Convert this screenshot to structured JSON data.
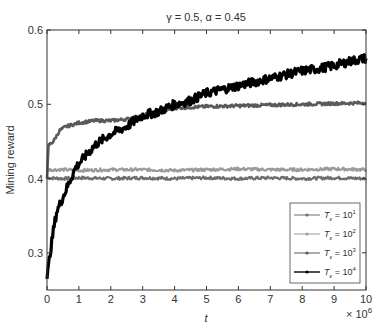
{
  "chart_data": {
    "type": "line",
    "title": "γ = 0.5,  α = 0.45",
    "xlabel": "t",
    "ylabel": "Mining reward",
    "x_multiplier_label": "× 10^6",
    "xlim": [
      0,
      10
    ],
    "ylim": [
      0.25,
      0.6
    ],
    "xticks": [
      0,
      1,
      2,
      3,
      4,
      5,
      6,
      7,
      8,
      9,
      10
    ],
    "yticks": [
      0.3,
      0.4,
      0.5,
      0.6
    ],
    "ytick_labels": [
      "0.3",
      "0.4",
      "0.5",
      "0.6"
    ],
    "grid": false,
    "legend_position": "lower right",
    "series": [
      {
        "name": "T_ε = 10^1",
        "legend_label": "T",
        "sub": "ε",
        "exp": "1",
        "color": "#6e6e6e",
        "width": 2.2,
        "x": [
          0,
          0.5,
          1,
          2,
          3,
          4,
          5,
          6,
          7,
          8,
          9,
          10
        ],
        "values": [
          0.401,
          0.4,
          0.401,
          0.4,
          0.401,
          0.4,
          0.401,
          0.4,
          0.401,
          0.4,
          0.401,
          0.4
        ]
      },
      {
        "name": "T_ε = 10^2",
        "legend_label": "T",
        "sub": "ε",
        "exp": "2",
        "color": "#9a9a9a",
        "width": 2.2,
        "x": [
          0,
          0.5,
          1,
          2,
          3,
          4,
          5,
          6,
          7,
          8,
          9,
          10
        ],
        "values": [
          0.412,
          0.412,
          0.411,
          0.412,
          0.412,
          0.411,
          0.412,
          0.413,
          0.412,
          0.412,
          0.413,
          0.412
        ]
      },
      {
        "name": "T_ε = 10^3",
        "legend_label": "T",
        "sub": "ε",
        "exp": "3",
        "color": "#5a5a5a",
        "width": 2.6,
        "x": [
          0,
          0.05,
          0.2,
          0.4,
          0.6,
          1,
          1.5,
          2,
          2.5,
          3,
          3.5,
          4,
          5,
          6,
          7,
          8,
          9,
          10
        ],
        "values": [
          0.4,
          0.445,
          0.45,
          0.465,
          0.47,
          0.475,
          0.478,
          0.478,
          0.48,
          0.485,
          0.49,
          0.495,
          0.497,
          0.498,
          0.499,
          0.5,
          0.501,
          0.502
        ]
      },
      {
        "name": "T_ε = 10^4",
        "legend_label": "T",
        "sub": "ε",
        "exp": "4",
        "color": "#000000",
        "width": 3.2,
        "x": [
          0,
          0.1,
          0.2,
          0.3,
          0.5,
          0.7,
          0.9,
          1.2,
          1.5,
          2,
          2.5,
          3,
          3.5,
          4,
          4.5,
          5,
          5.5,
          6,
          6.5,
          7,
          7.5,
          8,
          8.5,
          9,
          9.5,
          10
        ],
        "values": [
          0.265,
          0.3,
          0.33,
          0.355,
          0.375,
          0.395,
          0.415,
          0.43,
          0.445,
          0.46,
          0.47,
          0.485,
          0.49,
          0.5,
          0.505,
          0.515,
          0.52,
          0.525,
          0.53,
          0.535,
          0.54,
          0.545,
          0.548,
          0.552,
          0.558,
          0.562
        ]
      }
    ]
  }
}
